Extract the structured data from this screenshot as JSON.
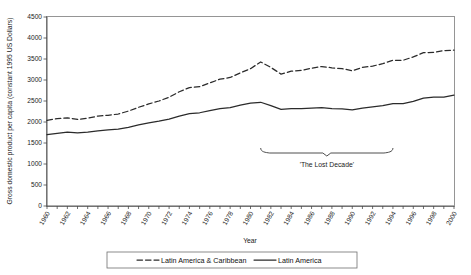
{
  "chart_data": {
    "type": "line",
    "title": "",
    "xlabel": "Year",
    "ylabel": "Gross domestic product per capita (constant 1995 US Dollars)",
    "xlim": [
      1960,
      2000
    ],
    "ylim": [
      0,
      4500
    ],
    "ytick_step": 500,
    "xtick_step": 2,
    "grid": false,
    "legend_position": "bottom",
    "yticks": [
      "0",
      "500",
      "1000",
      "1500",
      "2000",
      "2500",
      "3000",
      "3500",
      "4000",
      "4500"
    ],
    "xticks": [
      "1960",
      "1962",
      "1964",
      "1966",
      "1968",
      "1970",
      "1972",
      "1974",
      "1976",
      "1978",
      "1980",
      "1982",
      "1984",
      "1986",
      "1988",
      "1990",
      "1992",
      "1994",
      "1996",
      "1998",
      "2000"
    ],
    "x": [
      1960,
      1961,
      1962,
      1963,
      1964,
      1965,
      1966,
      1967,
      1968,
      1969,
      1970,
      1971,
      1972,
      1973,
      1974,
      1975,
      1976,
      1977,
      1978,
      1979,
      1980,
      1981,
      1982,
      1983,
      1984,
      1985,
      1986,
      1987,
      1988,
      1989,
      1990,
      1991,
      1992,
      1993,
      1994,
      1995,
      1996,
      1997,
      1998,
      1999,
      2000
    ],
    "series": [
      {
        "name": "Latin America & Caribbean",
        "style": "dashed",
        "color": "#2b2b2b",
        "values": [
          2040,
          2080,
          2100,
          2060,
          2090,
          2140,
          2160,
          2190,
          2260,
          2350,
          2430,
          2500,
          2590,
          2720,
          2820,
          2840,
          2930,
          3020,
          3060,
          3170,
          3270,
          3430,
          3300,
          3140,
          3210,
          3230,
          3280,
          3320,
          3290,
          3270,
          3220,
          3300,
          3330,
          3390,
          3470,
          3470,
          3550,
          3650,
          3660,
          3700,
          3710
        ]
      },
      {
        "name": "Latin America",
        "style": "solid",
        "color": "#2b2b2b",
        "values": [
          1700,
          1730,
          1760,
          1740,
          1760,
          1790,
          1810,
          1830,
          1870,
          1930,
          1980,
          2020,
          2070,
          2140,
          2200,
          2220,
          2270,
          2320,
          2340,
          2400,
          2450,
          2470,
          2390,
          2300,
          2320,
          2320,
          2330,
          2340,
          2320,
          2310,
          2290,
          2330,
          2360,
          2390,
          2440,
          2440,
          2490,
          2570,
          2590,
          2590,
          2640
        ]
      }
    ],
    "annotations": [
      {
        "text": "'The Lost Decade'",
        "x_start": 1981,
        "x_end": 1994,
        "kind": "brace-below"
      }
    ]
  },
  "legend": {
    "entries": [
      {
        "label": "Latin America & Caribbean",
        "style": "dashed"
      },
      {
        "label": "Latin America",
        "style": "solid"
      }
    ]
  }
}
